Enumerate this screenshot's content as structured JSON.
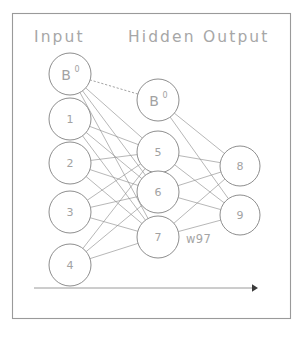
{
  "figure": {
    "background_color": "#ffffff",
    "border_color": "#9a9a9a",
    "node_stroke_color": "#8e8e8e",
    "edge_color": "#8a8a8a",
    "text_color": "#a2a2a2"
  },
  "headers": {
    "input": "Input",
    "hidden": "Hidden",
    "output": "Output"
  },
  "layers": {
    "input": {
      "name": "Input",
      "nodes": [
        {
          "label": "B",
          "superscript": "0",
          "is_bias": true,
          "cx": 70,
          "cy": 74,
          "r": 21
        },
        {
          "label": "1",
          "superscript": "",
          "is_bias": false,
          "cx": 70,
          "cy": 119,
          "r": 21
        },
        {
          "label": "2",
          "superscript": "",
          "is_bias": false,
          "cx": 70,
          "cy": 163,
          "r": 21
        },
        {
          "label": "3",
          "superscript": "",
          "is_bias": false,
          "cx": 70,
          "cy": 212,
          "r": 21
        },
        {
          "label": "4",
          "superscript": "",
          "is_bias": false,
          "cx": 70,
          "cy": 265,
          "r": 21
        }
      ]
    },
    "hidden": {
      "name": "Hidden",
      "nodes": [
        {
          "label": "B",
          "superscript": "0",
          "is_bias": true,
          "cx": 158,
          "cy": 100,
          "r": 21
        },
        {
          "label": "5",
          "superscript": "",
          "is_bias": false,
          "cx": 158,
          "cy": 152,
          "r": 21
        },
        {
          "label": "6",
          "superscript": "",
          "is_bias": false,
          "cx": 158,
          "cy": 192,
          "r": 21
        },
        {
          "label": "7",
          "superscript": "",
          "is_bias": false,
          "cx": 158,
          "cy": 237,
          "r": 21
        }
      ]
    },
    "output": {
      "name": "Output",
      "nodes": [
        {
          "label": "8",
          "superscript": "",
          "is_bias": false,
          "cx": 240,
          "cy": 166,
          "r": 20
        },
        {
          "label": "9",
          "superscript": "",
          "is_bias": false,
          "cx": 240,
          "cy": 215,
          "r": 20
        }
      ]
    }
  },
  "annotations": {
    "weight_label": "w97"
  },
  "chart_data": {
    "type": "diagram",
    "layer_names": [
      "Input",
      "Hidden",
      "Output"
    ],
    "layer_sizes": [
      5,
      4,
      2
    ],
    "input_nodes": [
      "B0",
      "1",
      "2",
      "3",
      "4"
    ],
    "hidden_nodes": [
      "B0",
      "5",
      "6",
      "7"
    ],
    "output_nodes": [
      "8",
      "9"
    ],
    "bias_nodes": [
      "B0 (input layer)",
      "B0 (hidden layer)"
    ],
    "connections": {
      "input_to_hidden": "fully connected from input nodes 1-4 to hidden nodes 5,6,7",
      "input_bias_to_hidden": "bias B0 connects to hidden nodes 5,6,7",
      "hidden_to_output": "fully connected from hidden nodes 5,6,7 to output nodes 8,9",
      "hidden_bias_to_output": "bias B0 connects to output nodes 8,9",
      "bias_to_bias": "dotted line from input bias B0 to hidden bias B0"
    },
    "labeled_weights": [
      {
        "label": "w97",
        "from": "7",
        "to": "9"
      }
    ],
    "flow_arrow": "horizontal arrow at bottom pointing right (forward propagation direction)"
  },
  "frame": {
    "x": 12,
    "y": 13,
    "width": 278,
    "height": 305
  },
  "flow_arrow": {
    "x1": 34,
    "y1": 288,
    "x2": 256,
    "y2": 288
  }
}
